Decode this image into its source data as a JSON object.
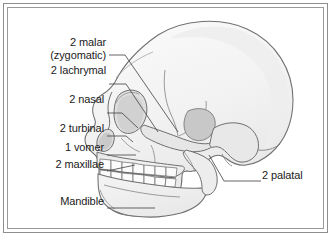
{
  "figure": {
    "background_color": "#ffffff",
    "frame": {
      "outer_border_color": "#8e8e8e",
      "inner_border_color": "#9a9a9a"
    },
    "drawing": {
      "name": "skull-lateral-diagram",
      "outline_color": "#6e6e6e",
      "fill_color": "#f2f2f2",
      "shade_color": "#e3e3e3",
      "dark_shade_color": "#cfcfcf",
      "leader_line_color": "#4a4a4a"
    }
  },
  "labels": [
    {
      "id": "malar",
      "text_line1": "2 malar",
      "text_line2": "(zygomatic)",
      "x": 42,
      "y": 36,
      "align": "right"
    },
    {
      "id": "lachrymal",
      "text_line1": "2 lachrymal",
      "text_line2": "",
      "x": 22,
      "y": 71,
      "align": "right"
    },
    {
      "id": "nasal",
      "text_line1": "2 nasal",
      "text_line2": "",
      "x": 42,
      "y": 100,
      "align": "right"
    },
    {
      "id": "turbinal",
      "text_line1": "2 turbinal",
      "text_line2": "",
      "x": 30,
      "y": 123,
      "align": "right"
    },
    {
      "id": "vomer",
      "text_line1": "1 vomer",
      "text_line2": "",
      "x": 40,
      "y": 142,
      "align": "right"
    },
    {
      "id": "maxillae",
      "text_line1": "2 maxillae",
      "text_line2": "",
      "x": 28,
      "y": 159,
      "align": "right"
    },
    {
      "id": "mandible",
      "text_line1": "Mandible",
      "text_line2": "",
      "x": 38,
      "y": 196,
      "align": "right"
    },
    {
      "id": "palatal",
      "text_line1": "2 palatal",
      "text_line2": "",
      "x": 257,
      "y": 170,
      "align": "left"
    }
  ],
  "leader_lines": [
    {
      "id": "malar-leader",
      "points": "101,47 117,47 170,124"
    },
    {
      "id": "lachrymal-leader",
      "points": "101,76 118,76 150,124"
    },
    {
      "id": "nasal-leader",
      "points": "99,105 114,105 128,119"
    },
    {
      "id": "turbinal-leader",
      "points": "99,128 118,128 124,134"
    },
    {
      "id": "vomer-leader",
      "points": "99,147 128,147"
    },
    {
      "id": "maxillae-leader",
      "points": "99,163 128,158"
    },
    {
      "id": "mandible-leader",
      "points": "99,200 147,200"
    },
    {
      "id": "palatal-leader",
      "points": "253,173 216,173 201,147"
    }
  ]
}
